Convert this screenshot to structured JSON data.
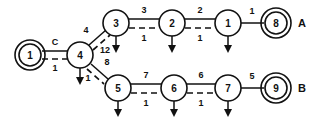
{
  "diagram": {
    "type": "node-link-graph",
    "background_color": "#ffffff",
    "stroke_color": "#111111",
    "nodes": [
      {
        "id": "n1",
        "label": "1",
        "shape": "double-circle",
        "cx": 30,
        "cy": 55,
        "r": 11
      },
      {
        "id": "n4",
        "label": "4",
        "shape": "circle",
        "cx": 80,
        "cy": 55,
        "r": 13
      },
      {
        "id": "n3",
        "label": "3",
        "shape": "circle",
        "cx": 116,
        "cy": 23,
        "r": 13
      },
      {
        "id": "n2",
        "label": "2",
        "shape": "circle",
        "cx": 172,
        "cy": 23,
        "r": 13
      },
      {
        "id": "nA1",
        "label": "1",
        "shape": "circle",
        "cx": 228,
        "cy": 23,
        "r": 13
      },
      {
        "id": "n8",
        "label": "8",
        "shape": "double-circle",
        "cx": 276,
        "cy": 23,
        "r": 11
      },
      {
        "id": "n5",
        "label": "5",
        "shape": "circle",
        "cx": 118,
        "cy": 88,
        "r": 13
      },
      {
        "id": "n6",
        "label": "6",
        "shape": "circle",
        "cx": 174,
        "cy": 88,
        "r": 13
      },
      {
        "id": "n7",
        "label": "7",
        "shape": "circle",
        "cx": 228,
        "cy": 88,
        "r": 13
      },
      {
        "id": "n9",
        "label": "9",
        "shape": "double-circle",
        "cx": 276,
        "cy": 88,
        "r": 11
      }
    ],
    "edges": [
      {
        "id": "e-1-4",
        "from": "n1",
        "to": "n4",
        "style": "solid+dashed",
        "top_label": "C",
        "bottom_label": "1"
      },
      {
        "id": "e-4-3",
        "from": "n4",
        "to": "n3",
        "style": "solid+dashed",
        "top_label": "4",
        "bottom_label": "12"
      },
      {
        "id": "e-3-2",
        "from": "n3",
        "to": "n2",
        "style": "solid+dashed",
        "top_label": "3",
        "bottom_label": "1"
      },
      {
        "id": "e-2-1",
        "from": "n2",
        "to": "nA1",
        "style": "solid+dashed",
        "top_label": "2",
        "bottom_label": "1"
      },
      {
        "id": "e-1-8",
        "from": "nA1",
        "to": "n8",
        "style": "solid",
        "top_label": "1",
        "bottom_label": ""
      },
      {
        "id": "e-4-5",
        "from": "n4",
        "to": "n5",
        "style": "solid+dashed",
        "top_label": "8",
        "bottom_label": "1"
      },
      {
        "id": "e-5-6",
        "from": "n5",
        "to": "n6",
        "style": "solid+dashed",
        "top_label": "7",
        "bottom_label": "1"
      },
      {
        "id": "e-6-7",
        "from": "n6",
        "to": "n7",
        "style": "solid+dashed",
        "top_label": "6",
        "bottom_label": "1"
      },
      {
        "id": "e-7-9",
        "from": "n7",
        "to": "n9",
        "style": "solid",
        "top_label": "5",
        "bottom_label": ""
      }
    ],
    "output_arrows": [
      {
        "id": "a-4",
        "node": "n4",
        "direction": "down"
      },
      {
        "id": "a-3",
        "node": "n3",
        "direction": "down"
      },
      {
        "id": "a-2",
        "node": "n2",
        "direction": "down"
      },
      {
        "id": "a-1",
        "node": "nA1",
        "direction": "down"
      },
      {
        "id": "a-5",
        "node": "n5",
        "direction": "down"
      },
      {
        "id": "a-6",
        "node": "n6",
        "direction": "down"
      },
      {
        "id": "a-7",
        "node": "n7",
        "direction": "down"
      }
    ],
    "group_labels": [
      {
        "id": "g-a",
        "text": "A",
        "x": 302,
        "y": 23
      },
      {
        "id": "g-b",
        "text": "B",
        "x": 302,
        "y": 88
      }
    ]
  }
}
